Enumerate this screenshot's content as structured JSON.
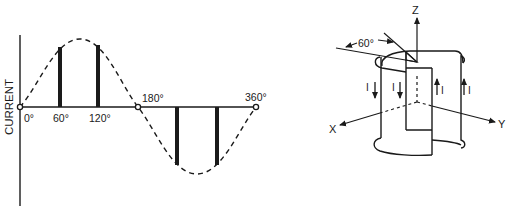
{
  "left_panel": {
    "title": "Sine wave of current",
    "y_axis_label": "CURRENT",
    "angle_labels": {
      "deg0": "0°",
      "deg60": "60°",
      "deg120": "120°",
      "deg180": "180°",
      "deg360": "360°"
    },
    "bars_at_degrees": [
      60,
      120,
      240,
      300
    ]
  },
  "right_panel": {
    "title": "Cylindrical coil with current directions",
    "axes": {
      "z": "Z",
      "x": "X",
      "y": "Y"
    },
    "angle_label": "60°",
    "current_labels": [
      "I",
      "I",
      "I",
      "I"
    ],
    "current_directions": [
      "down",
      "down",
      "up",
      "up"
    ]
  },
  "colors": {
    "ink": "#1a1a1a",
    "background": "#ffffff"
  }
}
